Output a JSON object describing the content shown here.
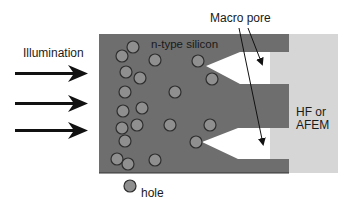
{
  "labels": {
    "illumination": "Illumination",
    "silicon": "n-type silicon",
    "macro_pore": "Macro pore",
    "electrolyte_line1": "HF or",
    "electrolyte_line2": "AFEM",
    "hole": "hole"
  },
  "colors": {
    "silicon": "#6e6e6e",
    "electrolyte": "#d6d6d6",
    "hole_fill": "#8f8f8f",
    "hole_stroke": "#2e2e2e",
    "arrow": "#111111"
  },
  "holes": [
    [
      133,
      47
    ],
    [
      122,
      56
    ],
    [
      155,
      60
    ],
    [
      126,
      72
    ],
    [
      140,
      78
    ],
    [
      198,
      61
    ],
    [
      212,
      79
    ],
    [
      125,
      92
    ],
    [
      175,
      92
    ],
    [
      123,
      111
    ],
    [
      142,
      108
    ],
    [
      122,
      128
    ],
    [
      137,
      125
    ],
    [
      170,
      125
    ],
    [
      210,
      125
    ],
    [
      125,
      141
    ],
    [
      196,
      142
    ],
    [
      117,
      159
    ],
    [
      128,
      164
    ],
    [
      155,
      160
    ]
  ]
}
